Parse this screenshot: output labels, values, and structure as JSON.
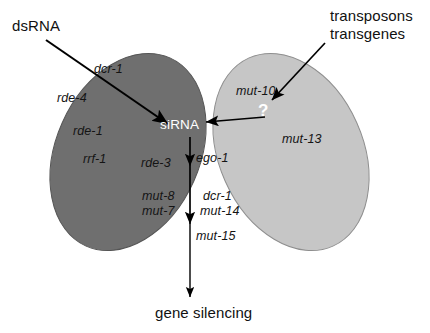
{
  "figure": {
    "background_color": "#ffffff"
  },
  "colors": {
    "left_ellipse": "#6f6f6f",
    "right_ellipse": "#c6c6c6",
    "overlap": "#9a9a9a",
    "outline": "#4a4a4a",
    "text": "#141414",
    "white_text": "#ffffff",
    "arrow": "#000000"
  },
  "inputs": {
    "dsrna_label": "dsRNA",
    "transposons_label": "transposons",
    "transgenes_label": "transgenes"
  },
  "hub": {
    "sirna_label": "siRNA",
    "unknown_label": "?"
  },
  "output": {
    "gene_silencing_label": "gene silencing"
  },
  "left_lobe": {
    "name": "dsRNA-specific branch",
    "genes": [
      "dcr-1",
      "rde-4",
      "rde-1",
      "rrf-1"
    ]
  },
  "right_lobe": {
    "name": "transposon/transgene-specific branch",
    "genes": [
      "mut-10",
      "mut-13"
    ]
  },
  "overlap_lobe": {
    "name": "shared downstream branch",
    "genes_left": [
      "rde-3",
      "mut-8",
      "mut-7"
    ],
    "genes_right": [
      "ego-1",
      "dcr-1",
      "mut-14"
    ],
    "genes_center": [
      "mut-15"
    ],
    "mut87_block": "mut-8\nmut-7",
    "dcr1_mut14_block": "dcr-1\nmut-14"
  },
  "gene_labels": {
    "dcr_1_top": "dcr-1",
    "rde_4": "rde-4",
    "rde_1": "rde-1",
    "rrf_1": "rrf-1",
    "mut_10": "mut-10",
    "mut_13": "mut-13",
    "rde_3": "rde-3",
    "ego_1": "ego-1",
    "mut_8": "mut-8",
    "mut_7": "mut-7",
    "dcr_1_mid": "dcr-1",
    "mut_14": "mut-14",
    "mut_15": "mut-15"
  }
}
